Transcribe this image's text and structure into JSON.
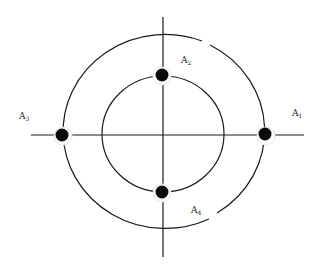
{
  "diagram": {
    "type": "concentric-circles-with-axes",
    "colors": {
      "stroke": "#1a1a1a",
      "dot": "#0a0a0a",
      "halo": "#ffffff",
      "background": "#ffffff"
    },
    "points": [
      {
        "id": "A1",
        "base": "A",
        "sub": "1",
        "position": "right",
        "circle": "outer"
      },
      {
        "id": "A2",
        "base": "A",
        "sub": "2",
        "position": "top",
        "circle": "inner"
      },
      {
        "id": "A3",
        "base": "A",
        "sub": "3",
        "position": "left",
        "circle": "outer"
      },
      {
        "id": "A4",
        "base": "A",
        "sub": "4",
        "position": "bottom",
        "circle": "inner"
      }
    ]
  }
}
